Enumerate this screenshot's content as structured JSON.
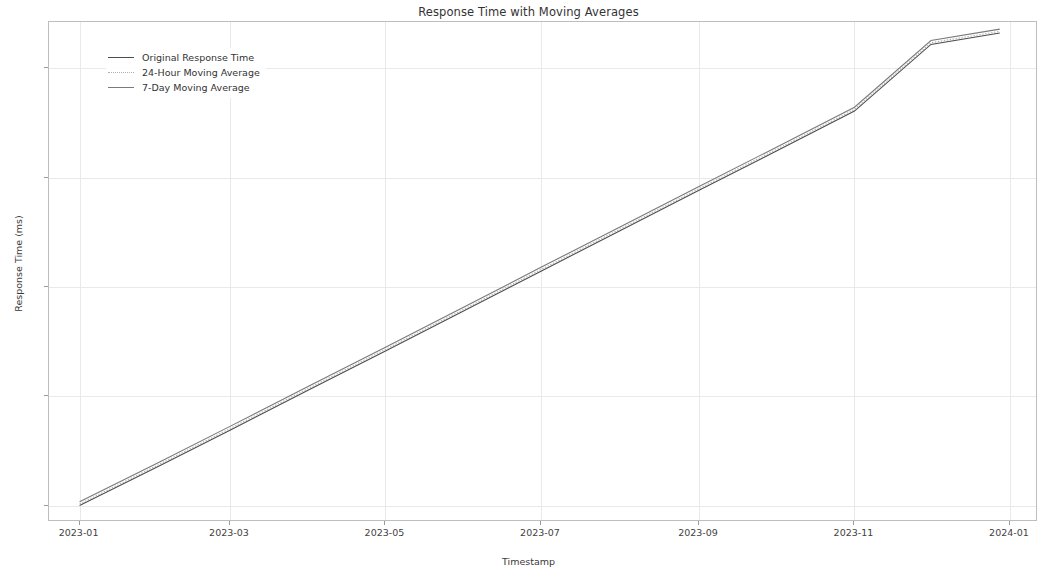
{
  "chart_data": {
    "type": "line",
    "title": "Response Time with Moving Averages",
    "xlabel": "Timestamp",
    "ylabel": "Response Time (ms)",
    "grid": true,
    "legend_position": "upper left",
    "xticklabels": [
      "2023-01",
      "2023-03",
      "2023-05",
      "2023-07",
      "2023-09",
      "2023-11",
      "2024-01"
    ],
    "yticklabels": [
      "200",
      "400",
      "600",
      "800",
      "1000"
    ],
    "ytickvalues": [
      200,
      400,
      600,
      800,
      1000
    ],
    "ylim": [
      170,
      1085
    ],
    "xlim": [
      "2022-12-20",
      "2024-01-12"
    ],
    "x": [
      "2023-01-01",
      "2023-02-01",
      "2023-03-01",
      "2023-04-01",
      "2023-05-01",
      "2023-06-01",
      "2023-07-01",
      "2023-08-01",
      "2023-09-01",
      "2023-10-01",
      "2023-11-01",
      "2023-12-01",
      "2023-12-28"
    ],
    "series": [
      {
        "name": "Original Response Time",
        "color": "#4d4d4d",
        "linestyle": "solid",
        "values": [
          200,
          272,
          338,
          412,
          483,
          557,
          629,
          703,
          777,
          848,
          922,
          1044,
          1065
        ]
      },
      {
        "name": "24-Hour Moving Average",
        "color": "#b0b0b0",
        "linestyle": "dotted",
        "values": [
          203,
          275,
          341,
          415,
          486,
          560,
          632,
          706,
          780,
          851,
          925,
          1047,
          1068
        ]
      },
      {
        "name": "7-Day Moving Average",
        "color": "#7a7a7a",
        "linestyle": "solid",
        "values": [
          207,
          279,
          345,
          419,
          490,
          564,
          636,
          710,
          784,
          855,
          929,
          1051,
          1072
        ]
      }
    ]
  }
}
